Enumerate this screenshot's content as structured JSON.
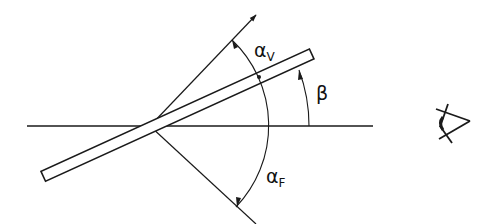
{
  "diagram": {
    "stroke_color": "#1a1a1a",
    "background": "#ffffff",
    "labels": {
      "alpha_v": {
        "symbol": "α",
        "subscript": "V"
      },
      "beta": {
        "symbol": "β"
      },
      "alpha_f": {
        "symbol": "α",
        "subscript": "F"
      }
    },
    "elements": {
      "horizontal_axis": "horizontal reference line",
      "plate": "inclined plate",
      "upper_ray": "upper viewing ray with arrow",
      "lower_ray": "lower ray",
      "observer": "eye-icon"
    }
  }
}
